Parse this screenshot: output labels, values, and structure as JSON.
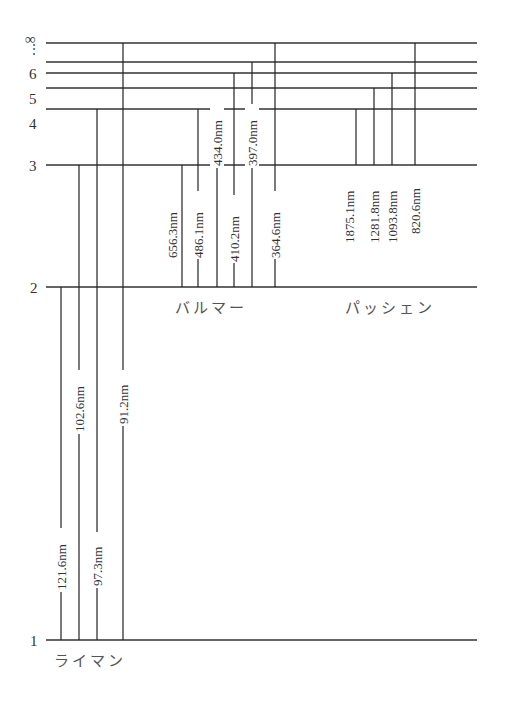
{
  "levels": [
    {
      "n": "1",
      "y": 640
    },
    {
      "n": "2",
      "y": 287
    },
    {
      "n": "3",
      "y": 165
    },
    {
      "n": "4",
      "y": 109
    },
    {
      "n": "5",
      "y": 88
    },
    {
      "n": "6",
      "y": 73
    },
    {
      "n": "",
      "y": 62
    },
    {
      "n": "∞",
      "y": 43
    }
  ],
  "level_labels": {
    "l1": "1",
    "l2": "2",
    "l3": "3",
    "l4": "4",
    "l5": "5",
    "l6": "6",
    "linf": "∞",
    "dots": "⋮"
  },
  "series": {
    "lyman": {
      "name": "ライマン",
      "lines": [
        "121.6nm",
        "102.6nm",
        "97.3nm",
        "91.2nm"
      ]
    },
    "balmer": {
      "name": "バルマー",
      "lines": [
        "656.3nm",
        "486.1nm",
        "434.0nm",
        "410.2nm",
        "397.0nm",
        "364.6nm"
      ]
    },
    "paschen": {
      "name": "パッシェン",
      "lines": [
        "1875.1nm",
        "1281.8nm",
        "1093.8nm",
        "820.6nm"
      ]
    }
  }
}
